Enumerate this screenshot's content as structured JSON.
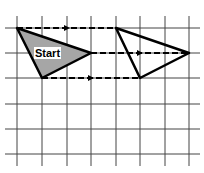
{
  "diagram": {
    "type": "translation",
    "grid": {
      "x_lines": [
        17,
        42,
        67,
        91,
        116,
        140,
        165,
        189
      ],
      "y_lines": [
        28,
        53,
        78,
        104,
        129,
        154
      ],
      "x_extent": [
        5,
        200
      ],
      "y_extent": [
        16,
        166
      ],
      "color": "#444444"
    },
    "start_shape": {
      "label": "Start",
      "points": [
        [
          17,
          28
        ],
        [
          91,
          53
        ],
        [
          42,
          78
        ]
      ],
      "fill": "#a6a6a6"
    },
    "image_shape": {
      "points": [
        [
          116,
          28
        ],
        [
          189,
          53
        ],
        [
          140,
          78
        ]
      ],
      "fill": "none"
    },
    "arrows": [
      {
        "from": [
          17,
          28
        ],
        "to": [
          116,
          28
        ],
        "arrow_at": [
          67,
          28
        ]
      },
      {
        "from": [
          91,
          53
        ],
        "to": [
          189,
          53
        ],
        "arrow_at": [
          140,
          53
        ]
      },
      {
        "from": [
          42,
          78
        ],
        "to": [
          140,
          78
        ],
        "arrow_at": [
          91,
          78
        ]
      }
    ]
  }
}
